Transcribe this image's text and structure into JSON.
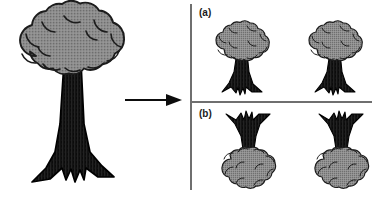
{
  "figure": {
    "title": "",
    "width": 380,
    "height": 198,
    "background_color": "#ffffff"
  },
  "colors": {
    "canopy_fill": "#8b8b8b",
    "canopy_fill_light": "#9a9a9a",
    "canopy_outline": "#1c1c1c",
    "trunk_fill": "#161616",
    "trunk_outline": "#000000",
    "divider_line": "#6f6f6f",
    "arrow": "#0d0d0d",
    "label_text": "#1a1a1a"
  },
  "left_panel": {
    "name": "source-tree",
    "tree": {
      "orientation": "upright",
      "description": "large tree with cloud-shaped canopy and flared roots"
    }
  },
  "arrow": {
    "name": "transform-arrow",
    "direction": "right",
    "glyph": "arrow-right-icon",
    "label": ""
  },
  "right_panel": {
    "sub_panels": [
      {
        "id": "a",
        "label": "(a)",
        "trees": [
          {
            "orientation": "upright",
            "name": "tree-a-1"
          },
          {
            "orientation": "upright",
            "name": "tree-a-2"
          }
        ]
      },
      {
        "id": "b",
        "label": "(b)",
        "trees": [
          {
            "orientation": "inverted",
            "name": "tree-b-1"
          },
          {
            "orientation": "inverted",
            "name": "tree-b-2"
          }
        ]
      }
    ]
  }
}
